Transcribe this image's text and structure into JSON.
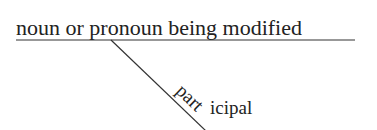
{
  "diagram": {
    "type": "sentence-diagram",
    "modified_label": "noun or pronoun being modified",
    "participle_part1": "part",
    "participle_part2": "icipal",
    "line_color": "#222222"
  }
}
